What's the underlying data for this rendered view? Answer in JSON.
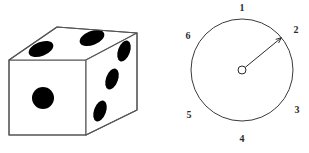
{
  "figure": {
    "background_color": "#ffffff",
    "ink_color": "#000000",
    "line_color": "#555555",
    "pip_color": "#000000",
    "label_color": "#2b2b2b"
  },
  "die": {
    "name": "six-sided die",
    "visible_faces": [
      {
        "face": "front",
        "pip_count": 1,
        "value": "1"
      },
      {
        "face": "top",
        "pip_count": 2,
        "value": "2"
      },
      {
        "face": "right",
        "pip_count": 3,
        "value": "3"
      }
    ],
    "front_pips": [
      {
        "cx": 43,
        "cy": 98,
        "r": 11
      }
    ],
    "top_pips": [
      {
        "cx": 41,
        "cy": 49,
        "rx": 13,
        "ry": 7,
        "rotate": -22
      },
      {
        "cx": 92,
        "cy": 38,
        "rx": 13,
        "ry": 7,
        "rotate": -22
      }
    ],
    "right_pips": [
      {
        "cx": 124,
        "cy": 51,
        "rx": 6,
        "ry": 11,
        "rotate": 20
      },
      {
        "cx": 112,
        "cy": 79,
        "rx": 6,
        "ry": 11,
        "rotate": 20
      },
      {
        "cx": 100,
        "cy": 111,
        "rx": 6,
        "ry": 11,
        "rotate": 20
      }
    ],
    "outline_path_front": "M 9 60 L 86 60 L 86 135 L 9 135 Z",
    "outline_path_top": "M 9 60 L 57 27 L 137 33 L 86 60 Z",
    "outline_path_right": "M 86 60 L 137 33 L 137 110 L 86 135 Z"
  },
  "spinner": {
    "name": "spinner dial",
    "circle": {
      "cx": 242,
      "cy": 70,
      "r": 51
    },
    "hub": {
      "cx": 242,
      "cy": 70,
      "r": 4
    },
    "pointer": {
      "from_x": 245,
      "from_y": 67,
      "to_x": 282,
      "to_y": 37,
      "points_between": "1 and 2"
    },
    "numbers": [
      {
        "label": "1",
        "x": 242,
        "y": 9,
        "position": "top"
      },
      {
        "label": "2",
        "x": 296,
        "y": 31,
        "position": "upper-right"
      },
      {
        "label": "3",
        "x": 297,
        "y": 111,
        "position": "lower-right"
      },
      {
        "label": "4",
        "x": 242,
        "y": 140,
        "position": "bottom"
      },
      {
        "label": "5",
        "x": 189,
        "y": 116,
        "position": "lower-left"
      },
      {
        "label": "6",
        "x": 188,
        "y": 37,
        "position": "upper-left"
      }
    ]
  }
}
